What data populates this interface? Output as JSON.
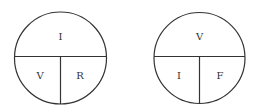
{
  "diagrams": [
    {
      "name": "ohms-law-circle",
      "top": "I",
      "bottom_left": "V",
      "bottom_right": "R"
    },
    {
      "name": "power-circle",
      "top": "V",
      "bottom_left": "I",
      "bottom_right": "F"
    }
  ],
  "colors": {
    "stroke": "#333333",
    "background": "#ffffff"
  }
}
